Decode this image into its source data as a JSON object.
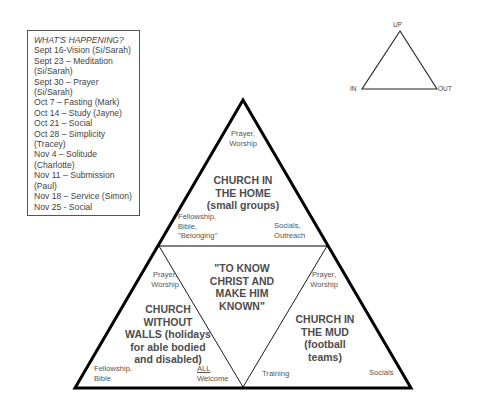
{
  "schedule": {
    "title": "WHAT'S HAPPENING?",
    "items": [
      "Sept 16-Vision (Si/Sarah)",
      "Sept 23 – Meditation",
      "(Si/Sarah)",
      "Sept 30 – Prayer",
      "(Si/Sarah)",
      "Oct 7 – Fasting (Mark)",
      "Oct 14 – Study (Jayne)",
      "Oct 21 – Social",
      "Oct 28 – Simplicity",
      "(Tracey)",
      "Nov 4 – Solitude",
      "(Charlotte)",
      "Nov 11 – Submission",
      "(Paul)",
      "Nov 18 – Service (Simon)",
      "Nov 25 - Social"
    ]
  },
  "small_triangle": {
    "up": "UP",
    "in": "IN",
    "out": "OUT"
  },
  "top_section": {
    "top_label_1": "Prayer,",
    "top_label_2": "Worship",
    "title_1": "CHURCH IN",
    "title_2": "THE HOME",
    "title_3": "(small groups)",
    "left_label_1": "Fellowship,",
    "left_label_2": "Bible,",
    "left_label_3": "\"Belonging\"",
    "right_label_1": "Socials,",
    "right_label_2": "Outreach"
  },
  "center_section": {
    "line_1": "\"TO KNOW",
    "line_2": "CHRIST AND",
    "line_3": "MAKE HIM",
    "line_4": "KNOWN\""
  },
  "left_section": {
    "top_label_1": "Prayer,",
    "top_label_2": "Worship",
    "title_1": "CHURCH",
    "title_2": "WITHOUT",
    "title_3": "WALLS (holidays",
    "title_4": "for able bodied",
    "title_5": "and disabled)",
    "left_label_1": "Fellowship,",
    "left_label_2": "Bible",
    "right_label_1": "ALL",
    "right_label_2": "Welcome"
  },
  "right_section": {
    "top_label_1": "Prayer,",
    "top_label_2": "Worship",
    "title_1": "CHURCH IN",
    "title_2": "THE MUD",
    "title_3": "(football",
    "title_4": "teams)",
    "left_label": "Training",
    "right_label": "Socials"
  },
  "colors": {
    "line": "#000000",
    "text": "#4a4a4a"
  }
}
